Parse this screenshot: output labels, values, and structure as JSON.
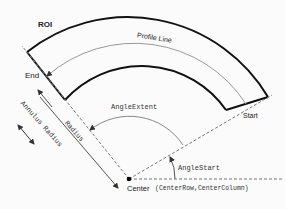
{
  "diagram": {
    "roi_label": "ROI",
    "profile_line_label": "Profile Line",
    "end_label": "End",
    "start_label": "Start",
    "annulus_radius_label": "Annulus Radius",
    "radius_label": "Radius",
    "angle_extent_label": "AngleExtent",
    "angle_start_label": "AngleStart",
    "center_label": "Center",
    "center_params_label": "(CenterRow,CenterColumn)"
  },
  "colors": {
    "roi_stroke": "#111111",
    "profile_stroke": "#888888",
    "dashed": "#777777",
    "text": "#222222"
  }
}
